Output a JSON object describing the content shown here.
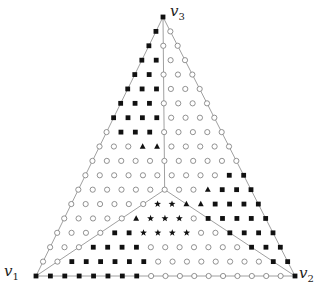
{
  "diagram": {
    "type": "simplex-lattice",
    "subdivisions": 18,
    "vertices": [
      {
        "id": "v1",
        "label": "v",
        "sub": "1",
        "x": 36,
        "y": 276,
        "label_x": 4,
        "label_y": 262
      },
      {
        "id": "v2",
        "label": "v",
        "sub": "2",
        "x": 295,
        "y": 276,
        "label_x": 299,
        "label_y": 264
      },
      {
        "id": "v3",
        "label": "v",
        "sub": "3",
        "x": 163,
        "y": 17,
        "label_x": 170,
        "label_y": 2
      }
    ],
    "centroid_lines": true,
    "marker_types": [
      "square",
      "circle",
      "triangle",
      "star"
    ],
    "colors": {
      "edge": "#888888",
      "marker_fill": "#111111",
      "circle_stroke": "#777777"
    }
  }
}
